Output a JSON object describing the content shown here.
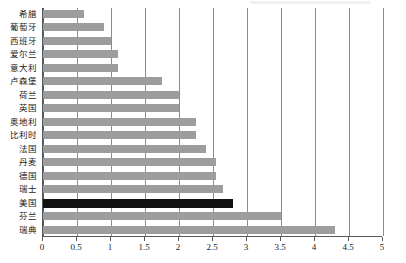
{
  "chart_data": {
    "type": "bar",
    "orientation": "horizontal",
    "title": "",
    "subtitle": "",
    "xlabel": "",
    "ylabel": "",
    "xlim": [
      0,
      5
    ],
    "ylim": null,
    "grid": true,
    "legend": null,
    "tick_labels": [
      "0",
      "0.5",
      "1",
      "1.5",
      "2",
      "2.5",
      "3",
      "3.5",
      "4",
      "4.5",
      "5"
    ],
    "tick_values": [
      0,
      0.5,
      1,
      1.5,
      2,
      2.5,
      3,
      3.5,
      4,
      4.5,
      5
    ],
    "categories": [
      "希腊",
      "葡萄牙",
      "西班牙",
      "爱尔兰",
      "意大利",
      "卢森堡",
      "荷兰",
      "英国",
      "奥地利",
      "比利时",
      "法国",
      "丹麦",
      "德国",
      "瑞士",
      "美国",
      "芬兰",
      "瑞典"
    ],
    "values": [
      0.6,
      0.9,
      1.0,
      1.1,
      1.1,
      1.75,
      2.0,
      2.0,
      2.25,
      2.25,
      2.4,
      2.55,
      2.55,
      2.65,
      2.8,
      3.5,
      4.3
    ],
    "highlight_category": "美国",
    "colors": {
      "bar": "#9d9d9d",
      "highlight_bar": "#111111",
      "gridline": "#8a8e91",
      "axis": "#55595c",
      "background": "#ffffff",
      "text": "#1a1a1a"
    }
  }
}
